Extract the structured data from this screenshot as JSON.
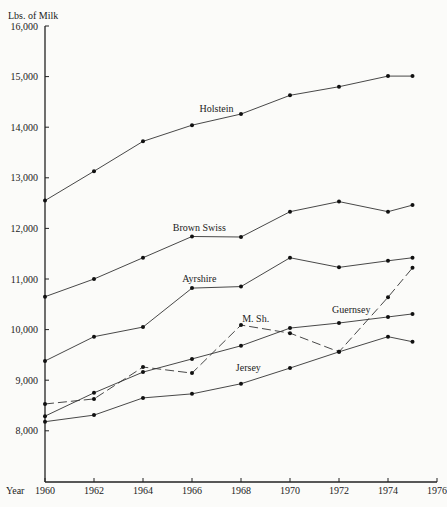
{
  "chart_data": {
    "type": "line",
    "title": "",
    "ylabel": "Lbs. of Milk",
    "xlabel": "Year",
    "ylim": [
      7000,
      16000
    ],
    "xlim": [
      1960,
      1976
    ],
    "grid": false,
    "legend": "inline labels",
    "x_ticks": [
      1960,
      1962,
      1964,
      1966,
      1968,
      1970,
      1972,
      1974,
      1976
    ],
    "y_ticks": [
      {
        "value": 8000,
        "label": "8,000"
      },
      {
        "value": 9000,
        "label": "9,000"
      },
      {
        "value": 10000,
        "label": "10,000"
      },
      {
        "value": 11000,
        "label": "11,000"
      },
      {
        "value": 12000,
        "label": "12,000"
      },
      {
        "value": 13000,
        "label": "13,000"
      },
      {
        "value": 14000,
        "label": "14,000"
      },
      {
        "value": 15000,
        "label": "15,000"
      },
      {
        "value": 16000,
        "label": "16,000"
      }
    ],
    "x": [
      1960,
      1962,
      1964,
      1966,
      1968,
      1970,
      1972,
      1974,
      1975
    ],
    "series": [
      {
        "name": "Holstein",
        "style": "solid",
        "label_pos": [
          1967,
          14300
        ],
        "values": [
          12550,
          13130,
          13720,
          14040,
          14260,
          14630,
          14800,
          15010,
          15010
        ]
      },
      {
        "name": "Brown Swiss",
        "style": "solid",
        "label_pos": [
          1966.3,
          11950
        ],
        "values": [
          10650,
          11000,
          11420,
          11840,
          11830,
          12330,
          12530,
          12330,
          12460
        ]
      },
      {
        "name": "Ayrshire",
        "style": "solid",
        "label_pos": [
          1966.3,
          10950
        ],
        "values": [
          9380,
          9860,
          10050,
          10820,
          10850,
          11420,
          11230,
          11360,
          11420
        ]
      },
      {
        "name": "M. Sh.",
        "style": "dashed",
        "label_pos": [
          1968.6,
          10150
        ],
        "values": [
          8530,
          8630,
          9260,
          9140,
          10090,
          9930,
          9560,
          10640,
          11220
        ]
      },
      {
        "name": "Guernsey",
        "style": "solid",
        "label_pos": [
          1972.5,
          10330
        ],
        "values": [
          8290,
          8750,
          9160,
          9420,
          9680,
          10030,
          10130,
          10250,
          10310
        ]
      },
      {
        "name": "Jersey",
        "style": "solid",
        "label_pos": [
          1968.3,
          9180
        ],
        "values": [
          8180,
          8310,
          8650,
          8730,
          8930,
          9240,
          9560,
          9860,
          9760
        ]
      }
    ]
  }
}
